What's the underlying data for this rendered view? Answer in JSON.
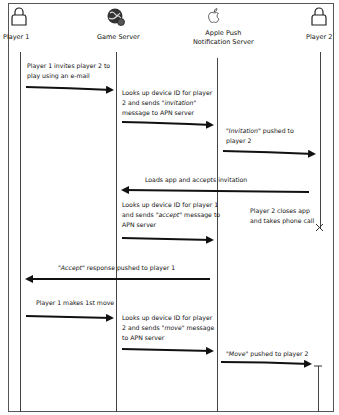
{
  "actors": [
    {
      "id": "player1",
      "label": "Player 1",
      "icon": "person-icon"
    },
    {
      "id": "game_server",
      "label": "Game Server",
      "icon": "globe-server-icon"
    },
    {
      "id": "apns",
      "label_line1": "Apple Push",
      "label_line2": "Notification Server",
      "icon": "apple-logo-icon"
    },
    {
      "id": "player2",
      "label": "Player 2",
      "icon": "person-icon"
    }
  ],
  "messages": [
    {
      "from": "player1",
      "to": "game_server",
      "line1": "Player 1 invites player 2 to",
      "line2": "play using an e-mail"
    },
    {
      "from": "game_server",
      "to": "apns",
      "line1": "Looks up device ID for player",
      "line2_pre": "2 and sends ",
      "line2_em": "\"invitation\"",
      "line3": "message to APN server"
    },
    {
      "from": "apns",
      "to": "player2",
      "line1_em": "\"Invitation\"",
      "line1_post": " pushed to",
      "line2": "player 2"
    },
    {
      "from": "player2",
      "to": "game_server",
      "line1": "Loads app and accepts invitation"
    },
    {
      "from": "game_server",
      "to": "apns",
      "line1": "Looks up device ID for player 1",
      "line2_pre": "and sends ",
      "line2_em": "\"accept\"",
      "line2_post": " message to",
      "line3": "APN server"
    },
    {
      "from": "player2",
      "to": "player2",
      "line1": "Player 2 closes app",
      "line2": "and takes phone call",
      "note": "lifeline terminated"
    },
    {
      "from": "apns",
      "to": "player1",
      "line1_em": "\"Accept\"",
      "line1_post": " response pushed to player 1"
    },
    {
      "from": "player1",
      "to": "game_server",
      "line1": "Player 1 makes 1st move"
    },
    {
      "from": "game_server",
      "to": "apns",
      "line1": "Looks up device ID for player",
      "line2_pre": "2 and sends ",
      "line2_em": "\"move\"",
      "line2_post": " message",
      "line3": "to APN server"
    },
    {
      "from": "apns",
      "to": "player2",
      "line1_em": "\"Move\"",
      "line1_post": " pushed to player 2"
    }
  ],
  "colors": {
    "line": "#444444",
    "arrow": "#111111",
    "frame": "#555555"
  }
}
